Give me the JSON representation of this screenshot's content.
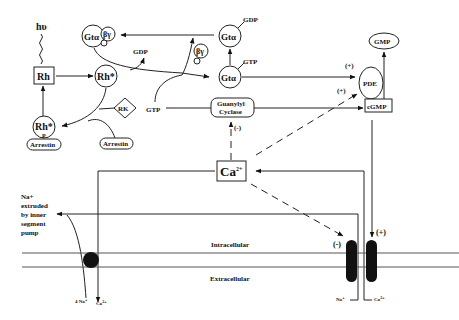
{
  "diagram": {
    "labels": {
      "light": "hυ",
      "rh": "Rh",
      "rh_star": "Rh*",
      "rh_star_p": "Rh*",
      "p": "P",
      "arrestin_bound": "Arrestin",
      "arrestin_free": "Arrestin",
      "rk": "RK",
      "gta_bg": "Gtα",
      "bg": "βγ",
      "bg_free": "βγ",
      "gdp_released": "GDP",
      "gtp_in": "GTP",
      "gta_gtp": "Gtα",
      "gtp_tag": "GTP",
      "gta_gdp": "Gtα",
      "gdp_tag": "GDP",
      "pde": "PDE",
      "gmp": "GMP",
      "cgmp": "cGMP",
      "gc_line1": "Guanylyl",
      "gc_line2": "Cyclase",
      "gc_gtp": "GTP",
      "ca": "Ca",
      "ca_sup": "2+",
      "plus_pde_gt": "(+)",
      "plus_pde_ca": "(+)",
      "minus_gc": "(-)",
      "minus_exchanger": "(-)",
      "plus_channel": "(+)",
      "na_extruded_1": "Na+",
      "na_extruded_2": "extruded",
      "na_extruded_3": "by inner",
      "na_extruded_4": "segment",
      "na_extruded_5": "pump",
      "intracellular": "Intracellular",
      "extracellular": "Extracellular",
      "four_na": "4 Na",
      "four_na_sup": "+",
      "ca_out": "Ca",
      "ca_out_sup": "2+",
      "na_in": "Na",
      "na_in_sup": "+",
      "ca_in": "Ca",
      "ca_in_sup": "2+"
    }
  }
}
